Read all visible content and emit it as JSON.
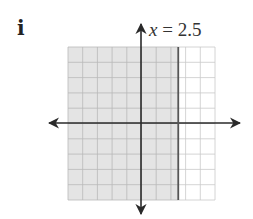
{
  "problem": {
    "label": "i",
    "equation_var": "x",
    "equation_rest": " = 2.5"
  },
  "graph": {
    "grid": {
      "cols": 10,
      "rows": 10,
      "x_range": [
        -5,
        5
      ],
      "y_range": [
        -5,
        5
      ]
    },
    "boundary": {
      "type": "vertical",
      "x": 2.5,
      "style": "solid"
    },
    "shaded_region": "x < 2.5",
    "colors": {
      "shade": "#e4e4e4",
      "grid_shaded": "#b9b9b9",
      "grid_unshaded": "#c9c9c9",
      "axis": "#2a2a2a",
      "boundary": "#555555"
    }
  },
  "chart_data": {
    "type": "inequality-graph",
    "title": "x = 2.5",
    "xlim": [
      -5,
      5
    ],
    "ylim": [
      -5,
      5
    ],
    "grid": true,
    "lines": [
      {
        "equation": "x = 2.5",
        "solid": true
      }
    ],
    "shaded": "left of x = 2.5 (x < 2.5)"
  }
}
